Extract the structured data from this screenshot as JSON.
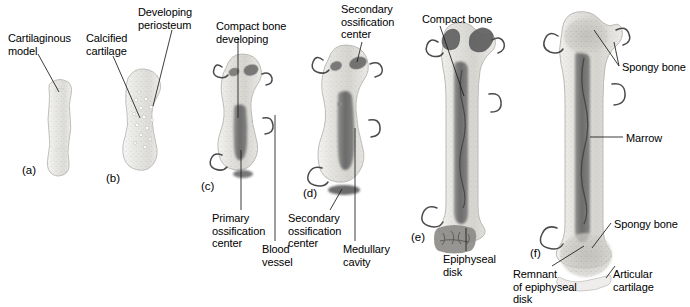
{
  "figure": {
    "background_color": "#ffffff",
    "width": 690,
    "height": 307
  },
  "panels": [
    {
      "id": "a",
      "letter": "(a)",
      "x": 22,
      "y": 164
    },
    {
      "id": "b",
      "letter": "(b)",
      "x": 106,
      "y": 172
    },
    {
      "id": "c",
      "letter": "(c)",
      "x": 201,
      "y": 180
    },
    {
      "id": "d",
      "letter": "(d)",
      "x": 303,
      "y": 187
    },
    {
      "id": "e",
      "letter": "(e)",
      "x": 411,
      "y": 231
    },
    {
      "id": "f",
      "letter": "(f)",
      "x": 530,
      "y": 247
    }
  ],
  "labels": [
    {
      "id": "cartilaginous-model",
      "text": "Cartilaginous\nmodel",
      "x": 8,
      "y": 32
    },
    {
      "id": "calcified-cartilage",
      "text": "Calcified\ncartilage",
      "x": 86,
      "y": 32
    },
    {
      "id": "developing-periosteum",
      "text": "Developing\nperiosteum",
      "x": 138,
      "y": 6
    },
    {
      "id": "compact-bone-developing",
      "text": "Compact bone\ndeveloping",
      "x": 216,
      "y": 20
    },
    {
      "id": "primary-ossification-center",
      "text": "Primary\nossification\ncenter",
      "x": 212,
      "y": 212
    },
    {
      "id": "blood-vessel",
      "text": "Blood\nvessel",
      "x": 262,
      "y": 243
    },
    {
      "id": "secondary-ossification-center-top",
      "text": "Secondary\nossification\ncenter",
      "x": 341,
      "y": 3
    },
    {
      "id": "secondary-ossification-center-bottom",
      "text": "Secondary\nossification\ncenter",
      "x": 288,
      "y": 212
    },
    {
      "id": "medullary-cavity",
      "text": "Medullary\ncavity",
      "x": 343,
      "y": 243
    },
    {
      "id": "compact-bone",
      "text": "Compact bone",
      "x": 422,
      "y": 13
    },
    {
      "id": "epiphyseal-disk",
      "text": "Epiphyseal\ndisk",
      "x": 443,
      "y": 253
    },
    {
      "id": "spongy-bone-top",
      "text": "Spongy bone",
      "x": 622,
      "y": 61
    },
    {
      "id": "marrow",
      "text": "Marrow",
      "x": 626,
      "y": 132
    },
    {
      "id": "spongy-bone-bottom",
      "text": "Spongy bone",
      "x": 614,
      "y": 218
    },
    {
      "id": "remnant-of-epiphyseal-disk",
      "text": "Remnant\nof epiphyseal\ndisk",
      "x": 513,
      "y": 268
    },
    {
      "id": "articular-cartilage",
      "text": "Articular\ncartilage",
      "x": 613,
      "y": 268
    }
  ],
  "colors": {
    "outline": "#9a9a9a",
    "cartilage_fill": "#e8e8e6",
    "cartilage_light": "#f2f2f0",
    "bone_fill": "#dddcd8",
    "spongy": "#c6c5c0",
    "dark_marrow": "#6e6e6e",
    "darker_marrow": "#5a5a5a",
    "vessel": "#4a4a4a",
    "label_text": "#000000",
    "leader_line": "#1a1a1a"
  }
}
